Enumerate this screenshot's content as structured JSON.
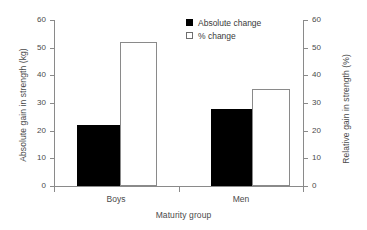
{
  "chart_data": {
    "type": "bar",
    "title": "",
    "xlabel": "Maturity group",
    "ylabel": "Absolute gain in strength (kg)",
    "y2label": "Relative gain in strength (%)",
    "categories": [
      "Boys",
      "Men"
    ],
    "series": [
      {
        "name": "Absolute change",
        "axis": "left",
        "unit": "kg",
        "values": [
          22,
          28
        ],
        "style": "filled"
      },
      {
        "name": "% change",
        "axis": "right",
        "unit": "%",
        "values": [
          52,
          35
        ],
        "style": "open"
      }
    ],
    "ylim": [
      0,
      60
    ],
    "y2lim": [
      0,
      60
    ],
    "yticks": [
      0,
      10,
      20,
      30,
      40,
      50,
      60
    ],
    "y2ticks": [
      0,
      10,
      20,
      30,
      40,
      50,
      60
    ],
    "ytick_labels": [
      "0",
      "10",
      "20",
      "30",
      "40",
      "50",
      "60"
    ],
    "y2tick_labels": [
      "0",
      "10",
      "20",
      "30",
      "40",
      "50",
      "60"
    ],
    "grid": false,
    "legend_position": "top-center"
  },
  "axes": {
    "left_title": "Absolute gain in strength (kg)",
    "right_title": "Relative gain in strength (%)",
    "x_title": "Maturity group"
  },
  "legend": {
    "items": [
      {
        "label": "Absolute change",
        "marker": "filled-square"
      },
      {
        "label": "% change",
        "marker": "open-square"
      }
    ]
  },
  "ticks": {
    "left": [
      "0",
      "10",
      "20",
      "30",
      "40",
      "50",
      "60"
    ],
    "right": [
      "0",
      "10",
      "20",
      "30",
      "40",
      "50",
      "60"
    ],
    "x": [
      "Boys",
      "Men"
    ]
  }
}
